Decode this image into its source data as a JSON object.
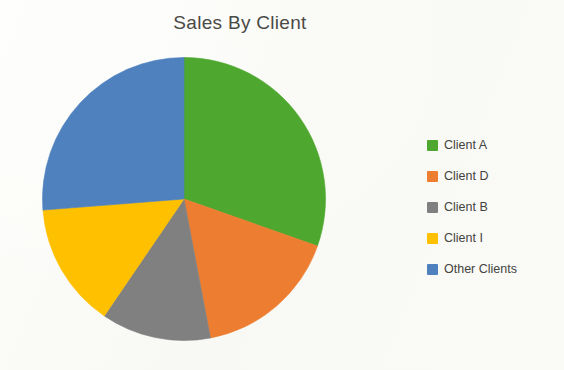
{
  "chart_data": {
    "type": "pie",
    "title": "Sales By Client",
    "xlabel": "",
    "ylabel": "",
    "legend_position": "right",
    "grid": false,
    "start_angle_deg": 0,
    "direction": "clockwise",
    "categories": [
      "Client A",
      "Client D",
      "Client B",
      "Client I",
      "Other Clients"
    ],
    "values": [
      30.4,
      16.6,
      12.5,
      14.2,
      26.3
    ],
    "units": "percent",
    "colors": [
      "#4EA72E",
      "#ED7D31",
      "#808080",
      "#FFC000",
      "#4E81BD"
    ],
    "slices": [
      {
        "label": "Client A",
        "value": 30.4,
        "color": "#4EA72E",
        "start_deg": 0.0,
        "end_deg": 109.4
      },
      {
        "label": "Client D",
        "value": 16.6,
        "color": "#ED7D31",
        "start_deg": 109.4,
        "end_deg": 169.2
      },
      {
        "label": "Client B",
        "value": 12.5,
        "color": "#808080",
        "start_deg": 169.2,
        "end_deg": 214.3
      },
      {
        "label": "Client I",
        "value": 14.2,
        "color": "#FFC000",
        "start_deg": 214.3,
        "end_deg": 265.5
      },
      {
        "label": "Other Clients",
        "value": 26.3,
        "color": "#4E81BD",
        "start_deg": 265.5,
        "end_deg": 360.0
      }
    ]
  },
  "title": {
    "text": "Sales By Client"
  },
  "legend": {
    "items": [
      {
        "label": "Client A",
        "color": "#4EA72E"
      },
      {
        "label": "Client D",
        "color": "#ED7D31"
      },
      {
        "label": "Client B",
        "color": "#808080"
      },
      {
        "label": "Client I",
        "color": "#FFC000"
      },
      {
        "label": "Other Clients",
        "color": "#4E81BD"
      }
    ]
  },
  "style": {
    "background": "#fbfbf9",
    "title_color": "#4a4a46",
    "legend_text_color": "#44443f"
  }
}
